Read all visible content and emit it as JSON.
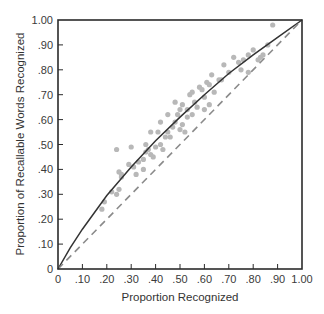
{
  "chart_data": {
    "type": "scatter",
    "title": "",
    "xlabel": "Proportion Recognized",
    "ylabel": "Proportion of Recallable Words Recognized",
    "xlim": [
      0,
      1
    ],
    "ylim": [
      0,
      1
    ],
    "grid": false,
    "legend": null,
    "x_ticks": [
      "0",
      ".10",
      ".20",
      ".30",
      ".40",
      ".50",
      ".60",
      ".70",
      ".80",
      ".90",
      "1.00"
    ],
    "y_ticks": [
      "0",
      ".10",
      ".20",
      ".30",
      ".40",
      ".50",
      ".60",
      ".70",
      ".80",
      ".90",
      "1.00"
    ],
    "series": [
      {
        "name": "observed",
        "kind": "points",
        "color": "#b8b8b8",
        "points": [
          [
            0.19,
            0.27
          ],
          [
            0.18,
            0.24
          ],
          [
            0.22,
            0.31
          ],
          [
            0.25,
            0.32
          ],
          [
            0.24,
            0.3
          ],
          [
            0.26,
            0.37
          ],
          [
            0.25,
            0.39
          ],
          [
            0.26,
            0.38
          ],
          [
            0.24,
            0.48
          ],
          [
            0.3,
            0.49
          ],
          [
            0.29,
            0.42
          ],
          [
            0.31,
            0.41
          ],
          [
            0.33,
            0.43
          ],
          [
            0.32,
            0.38
          ],
          [
            0.35,
            0.4
          ],
          [
            0.35,
            0.44
          ],
          [
            0.36,
            0.47
          ],
          [
            0.37,
            0.48
          ],
          [
            0.36,
            0.5
          ],
          [
            0.38,
            0.46
          ],
          [
            0.39,
            0.45
          ],
          [
            0.38,
            0.55
          ],
          [
            0.41,
            0.55
          ],
          [
            0.4,
            0.49
          ],
          [
            0.42,
            0.5
          ],
          [
            0.43,
            0.48
          ],
          [
            0.44,
            0.53
          ],
          [
            0.45,
            0.55
          ],
          [
            0.46,
            0.53
          ],
          [
            0.47,
            0.57
          ],
          [
            0.48,
            0.59
          ],
          [
            0.49,
            0.62
          ],
          [
            0.48,
            0.67
          ],
          [
            0.5,
            0.64
          ],
          [
            0.51,
            0.66
          ],
          [
            0.5,
            0.56
          ],
          [
            0.51,
            0.58
          ],
          [
            0.52,
            0.55
          ],
          [
            0.53,
            0.61
          ],
          [
            0.54,
            0.7
          ],
          [
            0.55,
            0.71
          ],
          [
            0.56,
            0.67
          ],
          [
            0.57,
            0.65
          ],
          [
            0.58,
            0.73
          ],
          [
            0.59,
            0.72
          ],
          [
            0.6,
            0.69
          ],
          [
            0.61,
            0.75
          ],
          [
            0.62,
            0.74
          ],
          [
            0.62,
            0.66
          ],
          [
            0.63,
            0.78
          ],
          [
            0.64,
            0.71
          ],
          [
            0.66,
            0.76
          ],
          [
            0.68,
            0.82
          ],
          [
            0.67,
            0.76
          ],
          [
            0.7,
            0.79
          ],
          [
            0.72,
            0.85
          ],
          [
            0.74,
            0.83
          ],
          [
            0.75,
            0.8
          ],
          [
            0.76,
            0.84
          ],
          [
            0.78,
            0.86
          ],
          [
            0.8,
            0.88
          ],
          [
            0.82,
            0.84
          ],
          [
            0.83,
            0.85
          ],
          [
            0.84,
            0.86
          ],
          [
            0.86,
            0.9
          ],
          [
            0.88,
            0.98
          ],
          [
            0.78,
            0.79
          ],
          [
            0.55,
            0.62
          ],
          [
            0.45,
            0.62
          ],
          [
            0.42,
            0.59
          ],
          [
            0.6,
            0.64
          ],
          [
            0.53,
            0.64
          ]
        ]
      },
      {
        "name": "model-curve",
        "kind": "solid-line",
        "color": "#333333",
        "points": [
          [
            0,
            0
          ],
          [
            0.05,
            0.085
          ],
          [
            0.1,
            0.16
          ],
          [
            0.2,
            0.295
          ],
          [
            0.3,
            0.41
          ],
          [
            0.4,
            0.515
          ],
          [
            0.5,
            0.61
          ],
          [
            0.6,
            0.7
          ],
          [
            0.7,
            0.785
          ],
          [
            0.8,
            0.86
          ],
          [
            0.9,
            0.93
          ],
          [
            1.0,
            1.0
          ]
        ]
      },
      {
        "name": "identity-line",
        "kind": "dashed-line",
        "color": "#8a8a8a",
        "points": [
          [
            0,
            0
          ],
          [
            1,
            1
          ]
        ]
      }
    ]
  }
}
